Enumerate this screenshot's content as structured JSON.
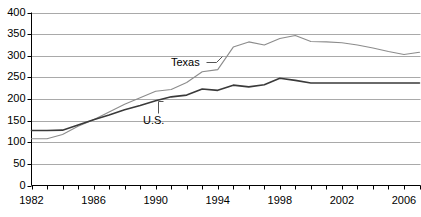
{
  "chart_data": {
    "type": "line",
    "title": "",
    "subtitle": "",
    "xlabel": "",
    "ylabel": "",
    "xlim": [
      1982,
      2007
    ],
    "ylim": [
      0,
      400
    ],
    "ytick_values": [
      0,
      50,
      100,
      150,
      200,
      250,
      300,
      350,
      400
    ],
    "ytick_labels": [
      "0",
      "50",
      "100",
      "150",
      "200",
      "250",
      "300",
      "350",
      "400"
    ],
    "xtick_values": [
      1982,
      1983,
      1984,
      1985,
      1986,
      1987,
      1988,
      1989,
      1990,
      1991,
      1992,
      1993,
      1994,
      1995,
      1996,
      1997,
      1998,
      1999,
      2000,
      2001,
      2002,
      2003,
      2004,
      2005,
      2006,
      2007
    ],
    "xtick_labeled": [
      1982,
      1986,
      1990,
      1994,
      1998,
      2002,
      2006
    ],
    "xtick_labels": [
      "1982",
      "1986",
      "1990",
      "1994",
      "1998",
      "2002",
      "2006"
    ],
    "grid": "horizontal",
    "legend_position": "inline-annotation",
    "x": [
      1982,
      1983,
      1984,
      1985,
      1986,
      1987,
      1988,
      1989,
      1990,
      1991,
      1992,
      1993,
      1994,
      1995,
      1996,
      1997,
      1998,
      1999,
      2000,
      2001,
      2002,
      2003,
      2004,
      2005,
      2006,
      2007
    ],
    "series": [
      {
        "name": "Texas",
        "color": "#8c8c8c",
        "values": [
          108,
          108,
          118,
          137,
          152,
          170,
          188,
          203,
          218,
          222,
          238,
          263,
          268,
          320,
          332,
          325,
          340,
          347,
          333,
          332,
          330,
          325,
          318,
          310,
          303,
          308
        ]
      },
      {
        "name": "U.S.",
        "color": "#3a3a3a",
        "values": [
          127,
          127,
          128,
          140,
          152,
          163,
          175,
          185,
          196,
          205,
          209,
          223,
          220,
          232,
          228,
          233,
          248,
          243,
          237,
          237,
          237,
          237,
          237,
          237,
          237,
          237
        ]
      }
    ],
    "annotations": [
      {
        "text": "Texas",
        "target_series": "Texas",
        "x": 1993
      },
      {
        "text": "U.S.",
        "target_series": "U.S.",
        "x": 1990
      }
    ]
  },
  "axis": {
    "axis_color": "#000000",
    "grid_color": "#a9a9a9"
  }
}
